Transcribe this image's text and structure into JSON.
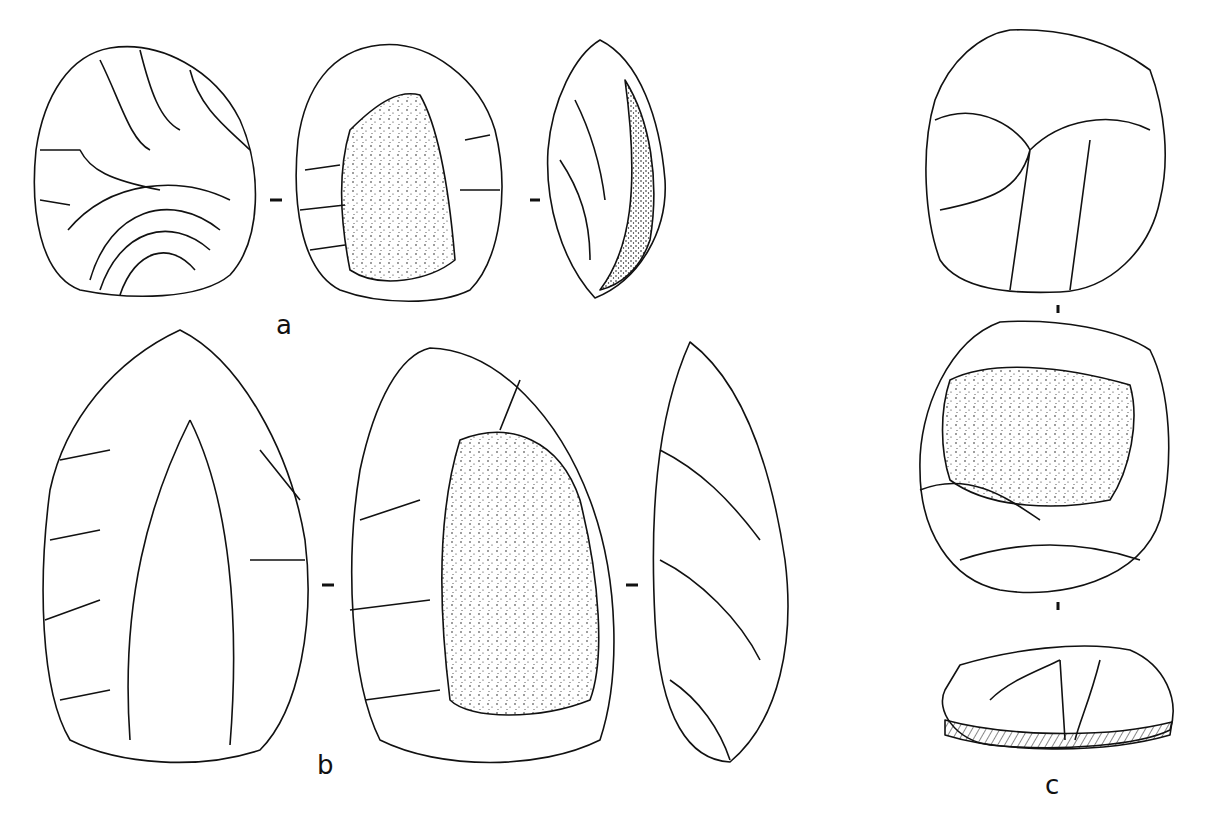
{
  "figure": {
    "ink_color": "#111111",
    "background": "#ffffff",
    "specimens": [
      {
        "label": "a",
        "views": 3,
        "view_types": [
          "face-flaked",
          "face-cortex",
          "profile"
        ]
      },
      {
        "label": "b",
        "views": 3,
        "view_types": [
          "face-flaked",
          "face-cortex",
          "profile"
        ]
      },
      {
        "label": "c",
        "views": 3,
        "view_types": [
          "face-flaked",
          "face-cortex",
          "profile"
        ]
      }
    ]
  }
}
